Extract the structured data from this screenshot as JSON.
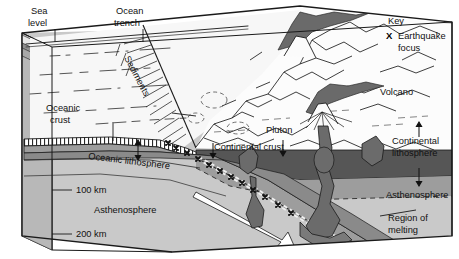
{
  "diagram": {
    "type": "geological-cross-section"
  },
  "key": {
    "heading": "Key",
    "symbol": "X",
    "symbol_name": "earthquake-focus-marker",
    "entry_line1": "Earthquake",
    "entry_line2": "focus"
  },
  "labels": {
    "sea_level_l1": "Sea",
    "sea_level_l2": "level",
    "ocean_trench_l1": "Ocean",
    "ocean_trench_l2": "trench",
    "sediments": "Sediments",
    "oceanic_crust_l1": "Oceanic",
    "oceanic_crust_l2": "crust",
    "oceanic_lithosphere": "Oceanic lithosphere",
    "continental_crust": "Continental crust",
    "continental_lithosphere_l1": "Continental",
    "continental_lithosphere_l2": "lithosphere",
    "pluton": "Pluton",
    "volcano": "Volcano",
    "asthenosphere_left": "Asthenosphere",
    "asthenosphere_right": "Asthenosphere",
    "region_of_melting_l1": "Region of",
    "region_of_melting_l2": "melting"
  },
  "depth_scale": {
    "ticks": [
      {
        "label": "100 km",
        "depth": 100
      },
      {
        "label": "200 km",
        "depth": 200
      }
    ]
  },
  "colors": {
    "outline": "#1a1a1a",
    "asthenosphere": "#c9c9c9",
    "lithosphere_mantle": "#9a9a9a",
    "slab_dark": "#6e6e6e",
    "continental_crust_dark": "#5a5a5a",
    "magma": "#6b6b6b",
    "ocean_water": "#f2f2f2",
    "land_surface": "#fbfbfb",
    "side_face": "#b4b4b4",
    "arrow_fill": "#ffffff"
  }
}
